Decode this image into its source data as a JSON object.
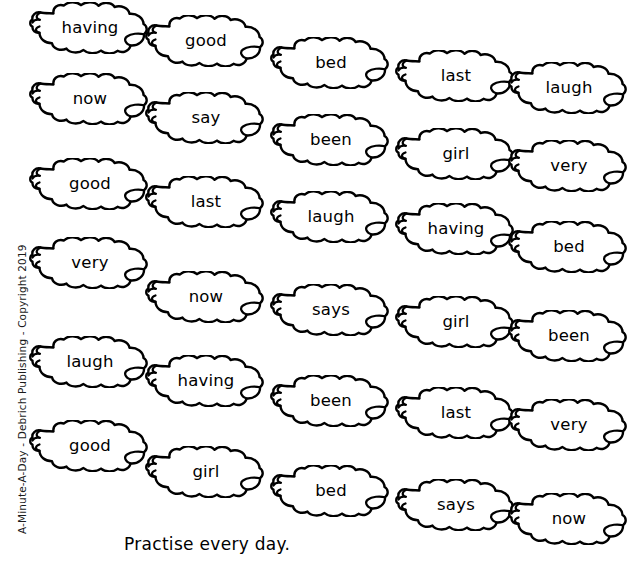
{
  "page": {
    "copyright_text": "A-Minute-A-Day - Debrich Publishing - Copyright 2019",
    "footer_instruction": "Practise every day.",
    "ink_color": "#000000",
    "background_color": "#ffffff"
  },
  "word_clouds": {
    "rows": [
      {
        "words": [
          "having",
          "good",
          "bed",
          "last",
          "laugh"
        ]
      },
      {
        "words": [
          "now",
          "say",
          "been",
          "girl",
          "very"
        ]
      },
      {
        "words": [
          "good",
          "last",
          "laugh",
          "having",
          "bed"
        ]
      },
      {
        "words": [
          "very",
          "now",
          "says",
          "girl",
          "been"
        ]
      },
      {
        "words": [
          "laugh",
          "having",
          "been",
          "last",
          "very"
        ]
      },
      {
        "words": [
          "good",
          "girl",
          "bed",
          "says",
          "now"
        ]
      }
    ],
    "flat_list": [
      "having",
      "good",
      "bed",
      "last",
      "laugh",
      "now",
      "say",
      "been",
      "girl",
      "very",
      "good",
      "last",
      "laugh",
      "having",
      "bed",
      "very",
      "now",
      "says",
      "girl",
      "been",
      "laugh",
      "having",
      "been",
      "last",
      "very",
      "good",
      "girl",
      "bed",
      "says",
      "now"
    ],
    "positions": [
      {
        "x": 26,
        "y": 2
      },
      {
        "x": 142,
        "y": 15
      },
      {
        "x": 267,
        "y": 37
      },
      {
        "x": 392,
        "y": 50
      },
      {
        "x": 505,
        "y": 62
      },
      {
        "x": 26,
        "y": 73
      },
      {
        "x": 142,
        "y": 92
      },
      {
        "x": 267,
        "y": 114
      },
      {
        "x": 392,
        "y": 128
      },
      {
        "x": 505,
        "y": 140
      },
      {
        "x": 26,
        "y": 158
      },
      {
        "x": 142,
        "y": 176
      },
      {
        "x": 267,
        "y": 191
      },
      {
        "x": 392,
        "y": 203
      },
      {
        "x": 505,
        "y": 221
      },
      {
        "x": 26,
        "y": 237
      },
      {
        "x": 142,
        "y": 271
      },
      {
        "x": 267,
        "y": 284
      },
      {
        "x": 392,
        "y": 296
      },
      {
        "x": 505,
        "y": 310
      },
      {
        "x": 26,
        "y": 336
      },
      {
        "x": 142,
        "y": 355
      },
      {
        "x": 267,
        "y": 375
      },
      {
        "x": 392,
        "y": 387
      },
      {
        "x": 505,
        "y": 399
      },
      {
        "x": 26,
        "y": 420
      },
      {
        "x": 142,
        "y": 446
      },
      {
        "x": 267,
        "y": 465
      },
      {
        "x": 392,
        "y": 479
      },
      {
        "x": 505,
        "y": 493
      }
    ]
  }
}
